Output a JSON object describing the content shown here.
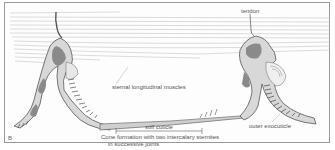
{
  "figure": {
    "panel_label": "B",
    "labels": {
      "tendon": "tendon",
      "sternal_muscles": "sternal longitudinal muscles",
      "stiff_cuticle": "stiff cuticle",
      "cone_line1": "Cone formation with two intercalary sternites",
      "cone_line2": "in successive joints",
      "outer_exocuticle": "outer exocuticle"
    },
    "colors": {
      "ink": "#555555",
      "dark_fill": "#8a8a8a",
      "muscle_lines": "#b5b5b5",
      "frame": "#9a9a9a"
    }
  }
}
